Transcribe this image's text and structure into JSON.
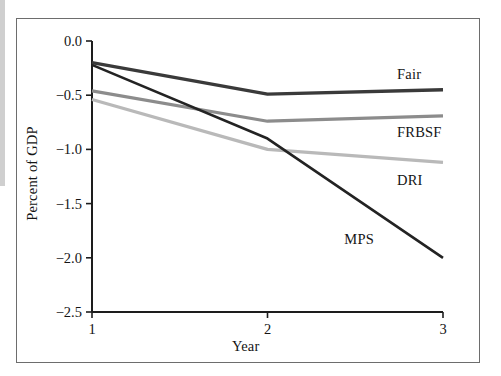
{
  "figure": {
    "background_color": "#ffffff",
    "frame_color": "#6d6d6d",
    "edge_bar_color": "#cfcfcf"
  },
  "chart_data": {
    "type": "line",
    "title": "",
    "subtitle": "",
    "xlabel": "Year",
    "ylabel": "Percent of GDP",
    "x": [
      1,
      2,
      3
    ],
    "categories": [
      "1",
      "2",
      "3"
    ],
    "xtick_labels": [
      "1",
      "2",
      "3"
    ],
    "ytick_labels": [
      "0.0",
      "−0.5",
      "−1.0",
      "−1.5",
      "−2.0",
      "−2.5"
    ],
    "ytick_values": [
      0.0,
      -0.5,
      -1.0,
      -1.5,
      -2.0,
      -2.5
    ],
    "xlim": [
      1,
      3
    ],
    "ylim": [
      -2.5,
      0.0
    ],
    "grid": false,
    "legend": "inline-labels-right",
    "series": [
      {
        "name": "Fair",
        "label": "Fair",
        "color": "#3a3a3a",
        "width": 3.4,
        "values": [
          -0.2,
          -0.49,
          -0.45
        ],
        "label_x": 3,
        "label_y": -0.3
      },
      {
        "name": "FRBSF",
        "label": "FRBSF",
        "color": "#8c8c8c",
        "width": 3.2,
        "values": [
          -0.46,
          -0.74,
          -0.69
        ],
        "label_x": 3,
        "label_y": -0.84
      },
      {
        "name": "DRI",
        "label": "DRI",
        "color": "#b9b9b9",
        "width": 3.2,
        "values": [
          -0.54,
          -1.0,
          -1.12
        ],
        "label_x": 3,
        "label_y": -1.28
      },
      {
        "name": "MPS",
        "label": "MPS",
        "color": "#232323",
        "width": 2.6,
        "values": [
          -0.22,
          -0.9,
          -2.0
        ],
        "label_x": 2.7,
        "label_y": -1.83
      }
    ],
    "annotations": [
      {
        "text": "Fair",
        "series": "Fair"
      },
      {
        "text": "FRBSF",
        "series": "FRBSF"
      },
      {
        "text": "DRI",
        "series": "DRI"
      },
      {
        "text": "MPS",
        "series": "MPS"
      }
    ]
  }
}
